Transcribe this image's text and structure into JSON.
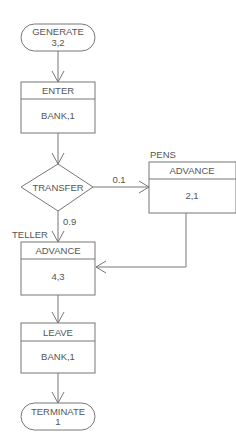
{
  "diagram": {
    "type": "GPSS block flowchart",
    "colors": {
      "stroke": "#777777",
      "text": "#555555",
      "background": "#ffffff"
    },
    "blocks": [
      {
        "id": "generate",
        "shape": "terminal",
        "line1": "GENERATE",
        "line2": "3,2"
      },
      {
        "id": "enter",
        "shape": "box",
        "header": "ENTER",
        "body": "BANK,1"
      },
      {
        "id": "transfer",
        "shape": "diamond",
        "label": "TRANSFER"
      },
      {
        "id": "pens",
        "shape": "box",
        "name_label": "PENS",
        "header": "ADVANCE",
        "body": "2,1"
      },
      {
        "id": "teller",
        "shape": "box",
        "name_label": "TELLER",
        "header": "ADVANCE",
        "body": "4,3"
      },
      {
        "id": "leave",
        "shape": "box",
        "header": "LEAVE",
        "body": "BANK,1"
      },
      {
        "id": "terminate",
        "shape": "terminal",
        "line1": "TERMINATE",
        "line2": "1"
      }
    ],
    "edges": [
      {
        "from": "generate",
        "to": "enter",
        "label": ""
      },
      {
        "from": "enter",
        "to": "transfer",
        "label": ""
      },
      {
        "from": "transfer",
        "to": "pens",
        "label": "0.1"
      },
      {
        "from": "transfer",
        "to": "teller",
        "label": "0.9"
      },
      {
        "from": "pens",
        "to": "teller",
        "label": ""
      },
      {
        "from": "teller",
        "to": "leave",
        "label": ""
      },
      {
        "from": "leave",
        "to": "terminate",
        "label": ""
      }
    ]
  }
}
